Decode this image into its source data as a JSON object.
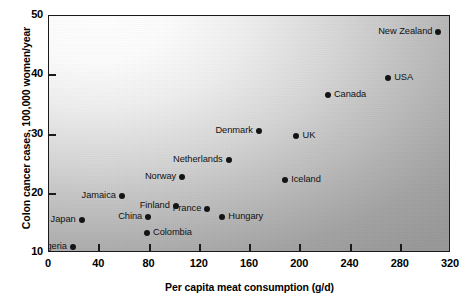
{
  "chart_data": {
    "type": "scatter",
    "title": "",
    "xlabel": "Per capita meat consumption (g/d)",
    "ylabel": "Colon cancer cases, 100,000 women/year",
    "xlim": [
      0,
      320
    ],
    "ylim": [
      10,
      50
    ],
    "xticks": [
      "0",
      "40",
      "80",
      "120",
      "160",
      "200",
      "240",
      "280",
      "320"
    ],
    "yticks": [
      "10",
      "20",
      "30",
      "40",
      "50"
    ],
    "grid": false,
    "legend": "none",
    "marker": "filled-circle",
    "marker_color": "#141414",
    "points": [
      {
        "label": "Nigeria",
        "x": 19,
        "y": 11.0,
        "label_side": "left"
      },
      {
        "label": "Japan",
        "x": 26,
        "y": 15.6,
        "label_side": "left"
      },
      {
        "label": "Jamaica",
        "x": 58,
        "y": 19.6,
        "label_side": "left"
      },
      {
        "label": "China",
        "x": 79,
        "y": 16.0,
        "label_side": "left"
      },
      {
        "label": "Colombia",
        "x": 78,
        "y": 13.4,
        "label_side": "right"
      },
      {
        "label": "Finland",
        "x": 101,
        "y": 18.0,
        "label_side": "left"
      },
      {
        "label": "Norway",
        "x": 106,
        "y": 22.9,
        "label_side": "left"
      },
      {
        "label": "France",
        "x": 126,
        "y": 17.4,
        "label_side": "left"
      },
      {
        "label": "Hungary",
        "x": 138,
        "y": 16.1,
        "label_side": "right"
      },
      {
        "label": "Netherlands",
        "x": 143,
        "y": 25.7,
        "label_side": "left"
      },
      {
        "label": "Denmark",
        "x": 167,
        "y": 30.6,
        "label_side": "left"
      },
      {
        "label": "Iceland",
        "x": 188,
        "y": 22.3,
        "label_side": "right"
      },
      {
        "label": "UK",
        "x": 197,
        "y": 29.8,
        "label_side": "right"
      },
      {
        "label": "Canada",
        "x": 222,
        "y": 36.6,
        "label_side": "right"
      },
      {
        "label": "USA",
        "x": 270,
        "y": 39.6,
        "label_side": "right"
      },
      {
        "label": "New Zealand",
        "x": 310,
        "y": 47.3,
        "label_side": "left"
      }
    ]
  }
}
